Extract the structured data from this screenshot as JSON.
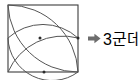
{
  "figure": {
    "type": "geometry-diagram",
    "stroke_color": "#4a4a4a",
    "square_stroke_color": "#3d3d3d",
    "point_color": "#2b2b2b",
    "background": "#ffffff",
    "square": {
      "x": 8,
      "y": 5,
      "width": 70,
      "height": 67
    },
    "arcs": [
      {
        "name": "petal-upper-right-arc-a",
        "from": "top-left-corner",
        "to": "bottom-right-corner",
        "bulge": "toward-top-right"
      },
      {
        "name": "petal-upper-right-arc-b",
        "from": "top-left-corner",
        "to": "bottom-right-corner",
        "bulge": "toward-bottom-left"
      },
      {
        "name": "petal-lower-left-arc-a",
        "from": "top-left-corner",
        "to": "bottom-right-corner",
        "bulge": "toward-top-right"
      },
      {
        "name": "petal-lower-left-arc-b",
        "from": "top-left-corner",
        "to": "bottom-right-corner",
        "bulge": "toward-bottom-left"
      }
    ],
    "intersection_points": [
      {
        "name": "point-center",
        "x": 40,
        "y": 38
      },
      {
        "name": "point-right-edge",
        "x": 78,
        "y": 38
      },
      {
        "name": "point-bottom-edge",
        "x": 44,
        "y": 72
      }
    ],
    "intersection_count": 3
  },
  "annotation": {
    "arrow_icon": "right-arrow-icon",
    "text": "3군데"
  }
}
